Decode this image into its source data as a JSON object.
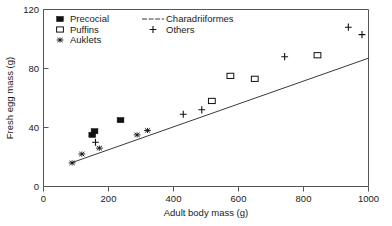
{
  "chart_data": {
    "type": "scatter",
    "title": "",
    "xlabel": "Adult body mass (g)",
    "ylabel": "Fresh egg mass (g)",
    "xlim": [
      0,
      1000
    ],
    "ylim": [
      0,
      120
    ],
    "xticks": [
      0,
      200,
      400,
      600,
      800,
      1000
    ],
    "yticks": [
      0,
      40,
      80,
      120
    ],
    "xtick_labels": [
      "0",
      "200",
      "400",
      "600",
      "800",
      "1000"
    ],
    "ytick_labels": [
      "0",
      "40",
      "80",
      "120"
    ],
    "grid": false,
    "legend_position": "top-left",
    "series": [
      {
        "name": "Precocial",
        "marker": "filled-square",
        "points": [
          [
            150,
            35
          ],
          [
            157,
            37.5
          ],
          [
            237,
            45
          ]
        ]
      },
      {
        "name": "Puffins",
        "marker": "open-square",
        "points": [
          [
            518,
            58
          ],
          [
            575,
            75
          ],
          [
            650,
            73
          ],
          [
            843,
            89
          ]
        ]
      },
      {
        "name": "Auklets",
        "marker": "star",
        "points": [
          [
            88,
            16
          ],
          [
            118,
            22
          ],
          [
            172,
            26
          ],
          [
            288,
            35
          ],
          [
            320,
            38
          ]
        ]
      },
      {
        "name": "Others",
        "marker": "plus",
        "points": [
          [
            160,
            30
          ],
          [
            430,
            49
          ],
          [
            487,
            52
          ],
          [
            742,
            88
          ],
          [
            938,
            108
          ],
          [
            980,
            103
          ]
        ]
      }
    ],
    "trendline": {
      "name": "Charadriiformes",
      "marker": "line",
      "x0": 85,
      "y0": 16,
      "x1": 1000,
      "y1": 87
    },
    "legend_entries": [
      {
        "label": "Precocial",
        "marker": "filled-square"
      },
      {
        "label": "Puffins",
        "marker": "open-square"
      },
      {
        "label": "Auklets",
        "marker": "star"
      },
      {
        "label": "Charadriiformes",
        "marker": "line"
      },
      {
        "label": "Others",
        "marker": "plus"
      }
    ],
    "colors": {
      "marker": "#111111",
      "axis": "#555555",
      "text": "#1a1a1a",
      "background": "#ffffff"
    }
  }
}
